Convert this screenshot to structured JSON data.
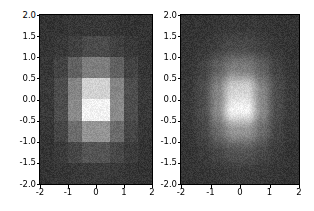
{
  "figure": {
    "width": 314,
    "height": 211,
    "background": "#ffffff",
    "colormap": "gray"
  },
  "chart_data": {
    "type": "heatmap",
    "title": "",
    "panels": [
      {
        "name": "nearest-interpolation-panel",
        "interpolation": "nearest",
        "xlabel": "",
        "ylabel": "",
        "xlim": [
          -2,
          2
        ],
        "ylim": [
          -2,
          2
        ],
        "xticks": [
          -2,
          -1,
          0,
          1,
          2
        ],
        "xtick_labels": [
          "-2",
          "-1",
          "0",
          "1",
          "2"
        ],
        "yticks": [
          2.0,
          1.5,
          1.0,
          0.5,
          0.0,
          -0.5,
          -1.0,
          -1.5,
          -2.0
        ],
        "ytick_labels": [
          "2.0",
          "1.5",
          "1.0",
          "0.5",
          "0.0",
          "-0.5",
          "-1.0",
          "-1.5",
          "-2.0"
        ],
        "grid": false,
        "cmap": "gray",
        "vmin": 0.0,
        "vmax": 1.0,
        "grid_shape": [
          8,
          8
        ],
        "noise_amplitude": 0.05,
        "gaussian": {
          "center_x": 0.0,
          "center_y": 0.15,
          "sigma_x": 0.62,
          "sigma_y": 0.78,
          "amplitude": 1.0,
          "baseline": 0.2
        },
        "values": [
          [
            0.2,
            0.2,
            0.21,
            0.22,
            0.22,
            0.21,
            0.2,
            0.2
          ],
          [
            0.2,
            0.22,
            0.25,
            0.29,
            0.29,
            0.25,
            0.22,
            0.2
          ],
          [
            0.21,
            0.26,
            0.38,
            0.49,
            0.49,
            0.38,
            0.26,
            0.21
          ],
          [
            0.22,
            0.3,
            0.52,
            0.82,
            0.82,
            0.52,
            0.3,
            0.22
          ],
          [
            0.22,
            0.3,
            0.54,
            0.95,
            0.95,
            0.54,
            0.3,
            0.22
          ],
          [
            0.21,
            0.27,
            0.42,
            0.58,
            0.58,
            0.42,
            0.27,
            0.21
          ],
          [
            0.2,
            0.23,
            0.28,
            0.33,
            0.33,
            0.28,
            0.23,
            0.2
          ],
          [
            0.2,
            0.21,
            0.22,
            0.23,
            0.23,
            0.22,
            0.21,
            0.2
          ]
        ]
      },
      {
        "name": "smooth-interpolation-panel",
        "interpolation": "gaussian",
        "xlabel": "",
        "ylabel": "",
        "xlim": [
          -2,
          2
        ],
        "ylim": [
          -2,
          2
        ],
        "xticks": [
          -2,
          -1,
          0,
          1,
          2
        ],
        "xtick_labels": [
          "-2",
          "-1",
          "0",
          "1",
          "2"
        ],
        "yticks": [
          2.0,
          1.5,
          1.0,
          0.5,
          0.0,
          -0.5,
          -1.0,
          -1.5,
          -2.0
        ],
        "ytick_labels": [
          "2.0",
          "1.5",
          "1.0",
          "0.5",
          "0.0",
          "-0.5",
          "-1.0",
          "-1.5",
          "-2.0"
        ],
        "grid": false,
        "cmap": "gray",
        "vmin": 0.0,
        "vmax": 1.0,
        "grid_shape": [
          8,
          8
        ],
        "noise_amplitude": 0.05,
        "gaussian": {
          "center_x": 0.0,
          "center_y": 0.15,
          "sigma_x": 0.62,
          "sigma_y": 0.78,
          "amplitude": 1.0,
          "baseline": 0.2
        },
        "values": [
          [
            0.2,
            0.2,
            0.21,
            0.22,
            0.22,
            0.21,
            0.2,
            0.2
          ],
          [
            0.2,
            0.22,
            0.25,
            0.29,
            0.29,
            0.25,
            0.22,
            0.2
          ],
          [
            0.21,
            0.26,
            0.38,
            0.49,
            0.49,
            0.38,
            0.26,
            0.21
          ],
          [
            0.22,
            0.3,
            0.52,
            0.82,
            0.82,
            0.52,
            0.3,
            0.22
          ],
          [
            0.22,
            0.3,
            0.54,
            0.95,
            0.95,
            0.54,
            0.3,
            0.22
          ],
          [
            0.21,
            0.27,
            0.42,
            0.58,
            0.58,
            0.42,
            0.27,
            0.21
          ],
          [
            0.2,
            0.23,
            0.28,
            0.33,
            0.33,
            0.28,
            0.23,
            0.2
          ],
          [
            0.2,
            0.21,
            0.22,
            0.23,
            0.23,
            0.22,
            0.21,
            0.2
          ]
        ]
      }
    ]
  }
}
